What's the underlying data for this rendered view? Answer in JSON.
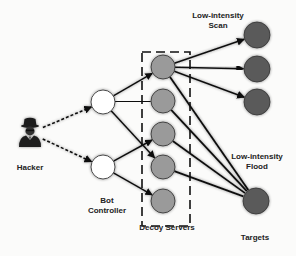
{
  "diagram": {
    "labels": {
      "hacker": "Hacker",
      "bot_controller_line1": "Bot",
      "bot_controller_line2": "Controller",
      "decoy_servers": "Decoy Servers",
      "scan_line1": "Low-intensity",
      "scan_line2": "Scan",
      "flood_line1": "Low-intensity",
      "flood_line2": "Flood",
      "targets": "Targets"
    },
    "colors": {
      "bot_node_fill": "#ffffff",
      "decoy_node_fill": "#9a9a9a",
      "target_node_fill": "#5a5a5a",
      "edge": "#111111",
      "dashed_box": "#111111"
    },
    "nodes": {
      "hacker": {
        "x": 30,
        "y": 133
      },
      "bot_controllers": [
        {
          "id": "bot-1",
          "x": 103,
          "y": 102
        },
        {
          "id": "bot-2",
          "x": 103,
          "y": 167
        }
      ],
      "decoy_servers": [
        {
          "id": "decoy-1",
          "x": 163,
          "y": 67
        },
        {
          "id": "decoy-2",
          "x": 163,
          "y": 101
        },
        {
          "id": "decoy-3",
          "x": 163,
          "y": 134
        },
        {
          "id": "decoy-4",
          "x": 163,
          "y": 167
        },
        {
          "id": "decoy-5",
          "x": 163,
          "y": 201
        }
      ],
      "targets": [
        {
          "id": "target-scan-1",
          "x": 257,
          "y": 35
        },
        {
          "id": "target-scan-2",
          "x": 257,
          "y": 69
        },
        {
          "id": "target-scan-3",
          "x": 257,
          "y": 102
        },
        {
          "id": "target-flood",
          "x": 256,
          "y": 201
        }
      ]
    },
    "edges": {
      "hacker_to_bot": [
        [
          "hacker",
          "bot-1"
        ],
        [
          "hacker",
          "bot-2"
        ]
      ],
      "bot_to_decoy": [
        [
          "bot-1",
          "decoy-1"
        ],
        [
          "bot-1",
          "decoy-2"
        ],
        [
          "bot-1",
          "decoy-4"
        ],
        [
          "bot-2",
          "decoy-3"
        ],
        [
          "bot-2",
          "decoy-4"
        ],
        [
          "bot-2",
          "decoy-5"
        ]
      ],
      "scan": [
        [
          "decoy-1",
          "target-scan-1"
        ],
        [
          "decoy-1",
          "target-scan-2"
        ],
        [
          "decoy-1",
          "target-scan-3"
        ]
      ],
      "flood": [
        [
          "decoy-1",
          "target-flood"
        ],
        [
          "decoy-2",
          "target-flood"
        ],
        [
          "decoy-3",
          "target-flood"
        ],
        [
          "decoy-4",
          "target-flood"
        ],
        [
          "decoy-5",
          "target-flood"
        ]
      ]
    }
  }
}
